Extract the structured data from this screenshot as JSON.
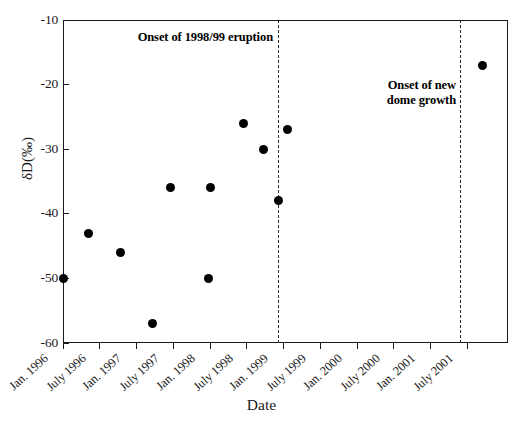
{
  "chart_data": {
    "type": "scatter",
    "title": "",
    "xlabel": "Date",
    "ylabel": "δD(‰)",
    "ylim": [
      -60,
      -10
    ],
    "yticks": [
      -10,
      -20,
      -30,
      -40,
      -50,
      -60
    ],
    "ytick_labels": [
      "-10",
      "-20",
      "-30",
      "-40",
      "-50",
      "-60"
    ],
    "grid": false,
    "legend": null,
    "xtick_labels": [
      "Jan. 1996",
      "July 1996",
      "Jan. 1997",
      "July 1997",
      "Jan. 1998",
      "July 1998",
      "Jan. 1999",
      "July 1999",
      "Jan. 2000",
      "July 2000",
      "Jan. 2001",
      "July 2001"
    ],
    "series": [
      {
        "name": "δD samples",
        "marker": "filled-circle",
        "color": "#000000",
        "points": [
          {
            "x": "Jan. 1996",
            "x_frac": 0.0,
            "y": -50
          },
          {
            "x": "Apr. 1996",
            "x_frac": 0.057,
            "y": -43
          },
          {
            "x": "Sep. 1996",
            "x_frac": 0.13,
            "y": -46
          },
          {
            "x": "Feb. 1997",
            "x_frac": 0.202,
            "y": -57
          },
          {
            "x": "Apr. 1997",
            "x_frac": 0.242,
            "y": -36
          },
          {
            "x": "Oct. 1997",
            "x_frac": 0.327,
            "y": -50
          },
          {
            "x": "Oct. 1997",
            "x_frac": 0.332,
            "y": -36
          },
          {
            "x": "Mar. 1998",
            "x_frac": 0.406,
            "y": -26
          },
          {
            "x": "Jun. 1998",
            "x_frac": 0.451,
            "y": -30
          },
          {
            "x": "Aug. 1998",
            "x_frac": 0.484,
            "y": -38
          },
          {
            "x": "Sep. 1998",
            "x_frac": 0.504,
            "y": -27
          },
          {
            "x": "Sep. 2001",
            "x_frac": 0.942,
            "y": -17
          }
        ]
      }
    ],
    "annotations": [
      {
        "id": "onset-eruption",
        "text": "Onset of 1998/99 eruption",
        "marker": "dashed-vertical-line",
        "x": "Jan. 1999"
      },
      {
        "id": "onset-dome",
        "text": "Onset of new\ndome growth",
        "marker": "dashed-vertical-line",
        "x": "July 2001"
      }
    ],
    "vlines": [
      {
        "id": "vline-eruption",
        "x_frac": 0.484
      },
      {
        "id": "vline-dome",
        "x_frac": 0.893
      }
    ]
  }
}
